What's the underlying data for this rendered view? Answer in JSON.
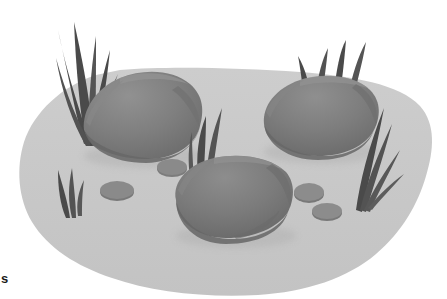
{
  "scene": {
    "title": "Rocky ground patch with boulders, pebbles and grass tufts",
    "width": 447,
    "height": 299,
    "background_color": "#ffffff",
    "style": "flat vector illustration, grayscale"
  },
  "caption": {
    "text_fragment": "s"
  },
  "palette": {
    "page_background": "#ffffff",
    "ground_fill": "#c9c9c9",
    "ground_shadow": "#bdbdbd",
    "rock_light": "#8e8e8e",
    "rock_mid": "#7c7c7c",
    "rock_dark": "#6b6b6b",
    "rock_darkest": "#5e5e5e",
    "pebble_fill": "#8a8a8a",
    "pebble_dark": "#767676",
    "grass_dark": "#4a4a4a",
    "grass_mid": "#5c5c5c",
    "shadow_soft": "#b4b4b4",
    "text_color": "#1a1a1a"
  },
  "ground": {
    "label": "ground-patch",
    "fill": "#c9c9c9",
    "approx_bounds": {
      "x": 18,
      "y": 68,
      "width": 412,
      "height": 228
    }
  },
  "rocks": [
    {
      "id": "rock-left",
      "label": "large boulder left",
      "fill": "#7c7c7c",
      "highlight": "#8e8e8e",
      "shade": "#6b6b6b",
      "center": {
        "x": 141,
        "y": 118
      },
      "radius": {
        "x": 58,
        "y": 42
      }
    },
    {
      "id": "rock-right",
      "label": "large boulder right",
      "fill": "#7c7c7c",
      "highlight": "#8e8e8e",
      "shade": "#6b6b6b",
      "center": {
        "x": 320,
        "y": 118
      },
      "radius": {
        "x": 57,
        "y": 38
      }
    },
    {
      "id": "rock-center-front",
      "label": "large boulder center foreground",
      "fill": "#7c7c7c",
      "highlight": "#8e8e8e",
      "shade": "#6b6b6b",
      "center": {
        "x": 232,
        "y": 197
      },
      "radius": {
        "x": 57,
        "y": 40
      }
    }
  ],
  "pebbles": [
    {
      "id": "pebble-1",
      "label": "small pebble left",
      "center": {
        "x": 117,
        "y": 190
      },
      "radius": {
        "x": 17,
        "y": 9
      },
      "fill": "#8a8a8a"
    },
    {
      "id": "pebble-2",
      "label": "small pebble mid upper",
      "center": {
        "x": 172,
        "y": 167
      },
      "radius": {
        "x": 15,
        "y": 8
      },
      "fill": "#8a8a8a"
    },
    {
      "id": "pebble-3",
      "label": "small pebble right upper",
      "center": {
        "x": 309,
        "y": 192
      },
      "radius": {
        "x": 15,
        "y": 9
      },
      "fill": "#8a8a8a"
    },
    {
      "id": "pebble-4",
      "label": "small pebble right lower",
      "center": {
        "x": 327,
        "y": 211
      },
      "radius": {
        "x": 15,
        "y": 8
      },
      "fill": "#8a8a8a"
    }
  ],
  "grass_tufts": [
    {
      "id": "grass-upper-left",
      "label": "tall grass tuft upper left",
      "blades": 6,
      "fill": "#4a4a4a",
      "anchor": {
        "x": 82,
        "y": 140
      }
    },
    {
      "id": "grass-lower-left",
      "label": "small grass tuft lower left",
      "blades": 3,
      "fill": "#4a4a4a",
      "anchor": {
        "x": 73,
        "y": 216
      }
    },
    {
      "id": "grass-center",
      "label": "grass blade center",
      "blades": 2,
      "fill": "#4a4a4a",
      "anchor": {
        "x": 206,
        "y": 178
      }
    },
    {
      "id": "grass-upper-right",
      "label": "grass tuft above right boulder",
      "blades": 4,
      "fill": "#4a4a4a",
      "anchor": {
        "x": 330,
        "y": 90
      }
    },
    {
      "id": "grass-right",
      "label": "grass tuft right side",
      "blades": 4,
      "fill": "#4a4a4a",
      "anchor": {
        "x": 372,
        "y": 205
      }
    }
  ]
}
